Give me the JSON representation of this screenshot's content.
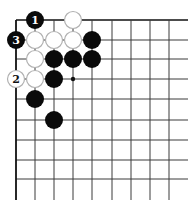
{
  "diagram": {
    "type": "go-board-corner",
    "grid": {
      "x_lines": [
        16,
        35,
        54,
        73,
        92,
        112,
        131,
        150,
        169
      ],
      "y_lines": [
        20,
        40,
        59,
        79,
        99,
        120,
        140,
        160,
        179
      ],
      "right_extent": 188,
      "bottom_extent": 200,
      "line_color": "#3a3a3a",
      "edge_color": "#111111"
    },
    "stone_radius": 9,
    "stones": [
      {
        "color": "black",
        "col": 1,
        "row": 0,
        "label": "1"
      },
      {
        "color": "white",
        "col": 3,
        "row": 0,
        "label": ""
      },
      {
        "color": "black",
        "col": 0,
        "row": 1,
        "label": "3"
      },
      {
        "color": "white",
        "col": 1,
        "row": 1,
        "label": ""
      },
      {
        "color": "white",
        "col": 2,
        "row": 1,
        "label": ""
      },
      {
        "color": "white",
        "col": 3,
        "row": 1,
        "label": ""
      },
      {
        "color": "black",
        "col": 4,
        "row": 1,
        "label": ""
      },
      {
        "color": "white",
        "col": 1,
        "row": 2,
        "label": ""
      },
      {
        "color": "black",
        "col": 2,
        "row": 2,
        "label": ""
      },
      {
        "color": "black",
        "col": 3,
        "row": 2,
        "label": ""
      },
      {
        "color": "black",
        "col": 4,
        "row": 2,
        "label": ""
      },
      {
        "color": "white",
        "col": 0,
        "row": 3,
        "label": "2"
      },
      {
        "color": "white",
        "col": 1,
        "row": 3,
        "label": ""
      },
      {
        "color": "black",
        "col": 2,
        "row": 3,
        "label": ""
      },
      {
        "color": "black",
        "col": 1,
        "row": 4,
        "label": ""
      },
      {
        "color": "black",
        "col": 2,
        "row": 5,
        "label": ""
      }
    ],
    "markers": [
      {
        "type": "dot",
        "col": 3,
        "row": 3
      }
    ],
    "colors": {
      "black_stone": "#0a0a0a",
      "white_stone": "#ffffff",
      "white_stone_border": "#b0b0b0",
      "black_label": "#ffffff",
      "white_label": "#111111"
    }
  }
}
